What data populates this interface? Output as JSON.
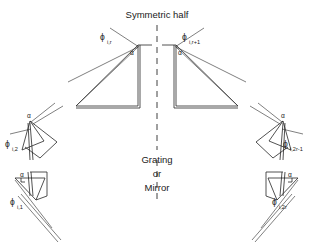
{
  "figure": {
    "title": "Symmetric half",
    "center_caption": {
      "line1": "Grating",
      "line2": "or",
      "line3": "Mirror"
    },
    "angle_symbol": "α",
    "phi_symbol": "ϕ",
    "labels": {
      "top_left": {
        "symbol": "ϕ",
        "subscript": "i,r"
      },
      "top_right": {
        "symbol": "ϕ",
        "subscript": "i,r+1"
      },
      "mid_left": {
        "symbol": "ϕ",
        "subscript": "i,2"
      },
      "bottom_left": {
        "symbol": "ϕ",
        "subscript": "i,1"
      },
      "mid_right": {
        "symbol": "ϕ",
        "subscript": "i,2r-1"
      },
      "bottom_right": {
        "symbol": "ϕ",
        "subscript": "i,2r"
      }
    },
    "apex_angles": [
      {
        "id": "apex-top-left",
        "label": "α"
      },
      {
        "id": "apex-top-right",
        "label": "α"
      },
      {
        "id": "apex-mid-left",
        "label": "α"
      },
      {
        "id": "apex-bottom-left",
        "label": "α"
      },
      {
        "id": "apex-mid-right",
        "label": "α"
      },
      {
        "id": "apex-bottom-right",
        "label": "α"
      }
    ],
    "colors": {
      "background": "#ffffff",
      "ink": "#262626",
      "ink_light": "#3a3a3a"
    }
  }
}
